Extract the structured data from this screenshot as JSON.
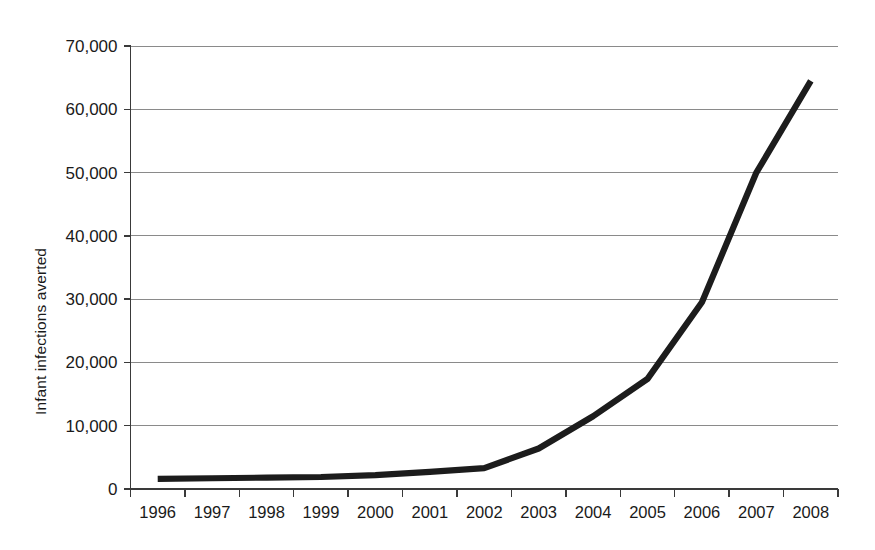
{
  "chart_data": {
    "type": "line",
    "title": "",
    "subtitle": "",
    "xlabel": "",
    "ylabel": "Infant infections averted",
    "categories": [
      "1996",
      "1997",
      "1998",
      "1999",
      "2000",
      "2001",
      "2002",
      "2003",
      "2004",
      "2005",
      "2006",
      "2007",
      "2008"
    ],
    "values": [
      1600,
      1700,
      1800,
      1900,
      2200,
      2700,
      3300,
      6400,
      11500,
      17400,
      29500,
      50000,
      64500
    ],
    "series": [
      {
        "name": "Infant infections averted",
        "color": "#1c1c1c",
        "values": [
          1600,
          1700,
          1800,
          1900,
          2200,
          2700,
          3300,
          6400,
          11500,
          17400,
          29500,
          50000,
          64500
        ]
      }
    ],
    "ylim": [
      0,
      70000
    ],
    "yticks": [
      0,
      10000,
      20000,
      30000,
      40000,
      50000,
      60000,
      70000
    ],
    "ytick_labels": [
      "0",
      "10,000",
      "20,000",
      "30,000",
      "40,000",
      "50,000",
      "60,000",
      "70,000"
    ],
    "grid": true,
    "grid_axis": "y",
    "legend": false,
    "legend_position": "none",
    "line_color": "#1c1c1c",
    "grid_color": "#8a8a8a",
    "axis_color": "#3a3a3a",
    "background": "#ffffff"
  },
  "axes": {
    "y_title": "Infant infections averted"
  }
}
